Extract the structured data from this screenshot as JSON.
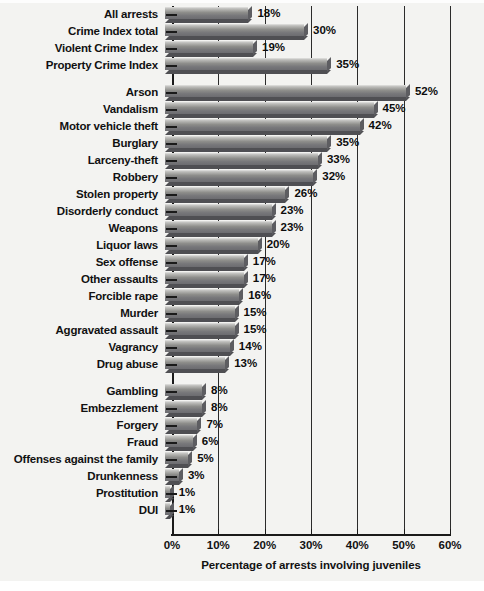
{
  "chart_data": {
    "type": "bar",
    "orientation": "horizontal",
    "title": "",
    "xlabel": "Percentage of arrests involving juveniles",
    "ylabel": "",
    "xlim": [
      0,
      60
    ],
    "xtick_labels": [
      "0%",
      "10%",
      "20%",
      "30%",
      "40%",
      "50%",
      "60%"
    ],
    "xtick_values": [
      0,
      10,
      20,
      30,
      40,
      50,
      60
    ],
    "grid": true,
    "grid_axis": "x",
    "legend": null,
    "value_label_suffix": "%",
    "bar_color": "#8e8e8b",
    "groups": [
      {
        "name": "summary",
        "categories": [
          "All arrests",
          "Crime Index total",
          "Violent Crime Index",
          "Property Crime Index"
        ],
        "values": [
          18,
          30,
          19,
          35
        ],
        "value_labels": [
          "18%",
          "30%",
          "19%",
          "35%"
        ]
      },
      {
        "name": "offenses",
        "categories": [
          "Arson",
          "Vandalism",
          "Motor vehicle theft",
          "Burglary",
          "Larceny-theft",
          "Robbery",
          "Stolen property",
          "Disorderly conduct",
          "Weapons",
          "Liquor laws",
          "Sex offense",
          "Other assaults",
          "Forcible rape",
          "Murder",
          "Aggravated assault",
          "Vagrancy",
          "Drug abuse"
        ],
        "values": [
          52,
          45,
          42,
          35,
          33,
          32,
          26,
          23,
          23,
          20,
          17,
          17,
          16,
          15,
          15,
          14,
          13
        ],
        "value_labels": [
          "52%",
          "45%",
          "42%",
          "35%",
          "33%",
          "32%",
          "26%",
          "23%",
          "23%",
          "20%",
          "17%",
          "17%",
          "16%",
          "15%",
          "15%",
          "14%",
          "13%"
        ]
      },
      {
        "name": "low-offenses",
        "categories": [
          "Gambling",
          "Embezzlement",
          "Forgery",
          "Fraud",
          "Offenses against the family",
          "Drunkenness",
          "Prostitution",
          "DUI"
        ],
        "values": [
          8,
          8,
          7,
          6,
          5,
          3,
          1,
          1
        ],
        "value_labels": [
          "8%",
          "8%",
          "7%",
          "6%",
          "5%",
          "3%",
          "1%",
          "1%"
        ]
      }
    ],
    "categories": [
      "All arrests",
      "Crime Index total",
      "Violent Crime Index",
      "Property Crime Index",
      "Arson",
      "Vandalism",
      "Motor vehicle theft",
      "Burglary",
      "Larceny-theft",
      "Robbery",
      "Stolen property",
      "Disorderly conduct",
      "Weapons",
      "Liquor laws",
      "Sex offense",
      "Other assaults",
      "Forcible rape",
      "Murder",
      "Aggravated assault",
      "Vagrancy",
      "Drug abuse",
      "Gambling",
      "Embezzlement",
      "Forgery",
      "Fraud",
      "Offenses against the family",
      "Drunkenness",
      "Prostitution",
      "DUI"
    ],
    "values": [
      18,
      30,
      19,
      35,
      52,
      45,
      42,
      35,
      33,
      32,
      26,
      23,
      23,
      20,
      17,
      17,
      16,
      15,
      15,
      14,
      13,
      8,
      8,
      7,
      6,
      5,
      3,
      1,
      1
    ]
  }
}
